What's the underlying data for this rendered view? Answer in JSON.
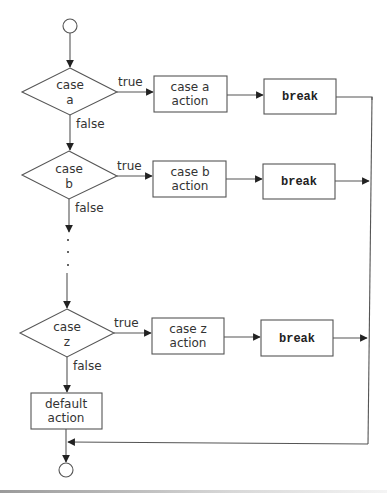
{
  "diagram": {
    "type": "flowchart",
    "start": {
      "shape": "circle"
    },
    "end": {
      "shape": "circle"
    },
    "cases": [
      {
        "id": "a",
        "decision_line1": "case",
        "decision_line2": "a",
        "action_line1": "case a",
        "action_line2": "action",
        "break_label": "break",
        "true_label": "true",
        "false_label": "false"
      },
      {
        "id": "b",
        "decision_line1": "case",
        "decision_line2": "b",
        "action_line1": "case b",
        "action_line2": "action",
        "break_label": "break",
        "true_label": "true",
        "false_label": "false"
      },
      {
        "id": "z",
        "decision_line1": "case",
        "decision_line2": "z",
        "action_line1": "case z",
        "action_line2": "action",
        "break_label": "break",
        "true_label": "true",
        "false_label": "false"
      }
    ],
    "ellipsis": "...",
    "default": {
      "line1": "default",
      "line2": "action"
    },
    "colors": {
      "stroke": "#555555",
      "text": "#333333",
      "background": "#ffffff"
    }
  }
}
